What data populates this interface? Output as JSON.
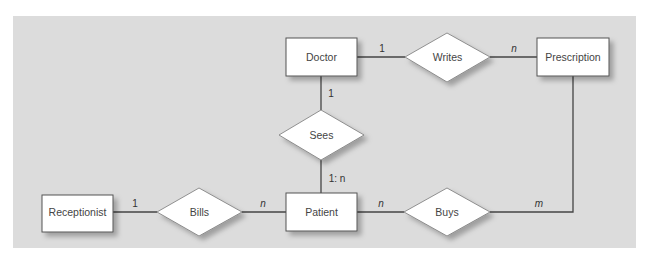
{
  "diagram": {
    "type": "entity-relationship",
    "colors": {
      "background": "#ffffff",
      "panel": "#dcdcdc",
      "shape_fill": "#ffffff",
      "shape_stroke": "#555555",
      "line": "#444444",
      "shadow": "#b4b4b4",
      "text": "#444444"
    },
    "entities": {
      "doctor": "Doctor",
      "prescription": "Prescription",
      "receptionist": "Receptionist",
      "patient": "Patient"
    },
    "relationships": {
      "writes": "Writes",
      "sees": "Sees",
      "bills": "Bills",
      "buys": "Buys"
    },
    "cardinalities": {
      "doctor_writes": "1",
      "writes_prescription": "n",
      "doctor_sees": "1",
      "sees_patient": "1: n",
      "receptionist_bills": "1",
      "bills_patient": "n",
      "patient_buys": "n",
      "buys_prescription": "m"
    },
    "connections": [
      {
        "from": "Doctor",
        "via": "Writes",
        "to": "Prescription",
        "cardinality": [
          "1",
          "n"
        ]
      },
      {
        "from": "Doctor",
        "via": "Sees",
        "to": "Patient",
        "cardinality": [
          "1",
          "1: n"
        ]
      },
      {
        "from": "Receptionist",
        "via": "Bills",
        "to": "Patient",
        "cardinality": [
          "1",
          "n"
        ]
      },
      {
        "from": "Patient",
        "via": "Buys",
        "to": "Prescription",
        "cardinality": [
          "n",
          "m"
        ]
      }
    ]
  }
}
